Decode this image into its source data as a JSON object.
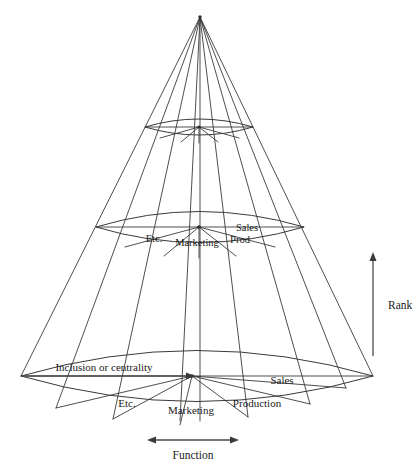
{
  "figure": {
    "background_color": "#ffffff",
    "line_color": "#3a3a3a",
    "text_color": "#1a1a1a",
    "width": 418,
    "height": 469
  },
  "axes": {
    "rank": {
      "label": "Rank",
      "direction": "up",
      "x": 373,
      "y_top": 256,
      "y_bottom": 356,
      "label_x": 388,
      "label_y": 306
    },
    "function": {
      "label": "Function",
      "direction": "horizontal-double",
      "y": 440,
      "x_left": 148,
      "x_right": 238,
      "label_x": 193,
      "label_y": 455
    },
    "inclusion": {
      "label": "Inclusion or centrality",
      "direction": "right",
      "y": 376,
      "x_left": 22,
      "x_right": 192,
      "label_x": 104,
      "label_y": 368
    }
  },
  "rings": [
    {
      "name": "top-ring",
      "center_x": 199,
      "center_y": 127,
      "rx": 54,
      "ry": 14,
      "sectors": []
    },
    {
      "name": "middle-ring",
      "center_x": 199,
      "center_y": 227,
      "rx": 104,
      "ry": 27,
      "sectors": [
        {
          "label": "Etc.",
          "x": 154,
          "y": 240
        },
        {
          "label": "Marketing",
          "x": 197,
          "y": 244
        },
        {
          "label": "Prod",
          "x": 240,
          "y": 241
        },
        {
          "label": "Sales",
          "x": 247,
          "y": 229
        }
      ]
    },
    {
      "name": "bottom-ring",
      "center_x": 197,
      "center_y": 376,
      "rx": 176,
      "ry": 45,
      "sectors": [
        {
          "label": "Etc.",
          "x": 127,
          "y": 404
        },
        {
          "label": "Marketing",
          "x": 191,
          "y": 411
        },
        {
          "label": "Production",
          "x": 257,
          "y": 404
        },
        {
          "label": "Sales",
          "x": 282,
          "y": 381
        }
      ]
    }
  ],
  "apex": {
    "x": 200,
    "y": 17
  },
  "generator_count": 9,
  "sector_count": 8
}
